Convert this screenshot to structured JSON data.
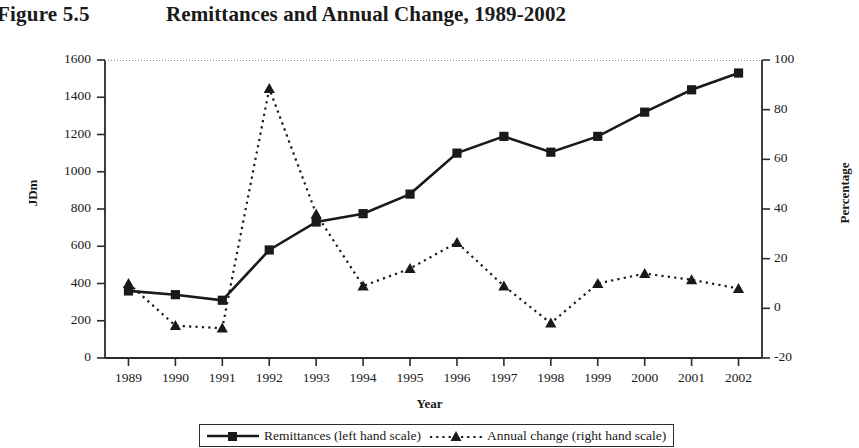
{
  "figure": {
    "label": "Figure 5.5",
    "title": "Remittances and Annual Change, 1989-2002"
  },
  "chart_data": {
    "type": "line",
    "title": "Remittances and Annual Change, 1989-2002",
    "figure_label": "Figure 5.5",
    "xlabel": "Year",
    "ylabel": "JDm",
    "y2label": "Percentage",
    "grid": false,
    "legend_position": "bottom",
    "categories": [
      "1989",
      "1990",
      "1991",
      "1992",
      "1993",
      "1994",
      "1995",
      "1996",
      "1997",
      "1998",
      "1999",
      "2000",
      "2001",
      "2002"
    ],
    "x_tick_labels": [
      "1989",
      "1990",
      "1991",
      "1992",
      "1993",
      "1994",
      "1995",
      "1996",
      "1997",
      "1998",
      "1999",
      "2000",
      "2001",
      "2002"
    ],
    "ylim": [
      0,
      1600
    ],
    "y_tick_labels": [
      "1600",
      "1400",
      "1200",
      "1000",
      "800",
      "600",
      "400",
      "200",
      "0"
    ],
    "y_ticks": [
      1600,
      1400,
      1200,
      1000,
      800,
      600,
      400,
      200,
      0
    ],
    "y2lim": [
      -20,
      100
    ],
    "y2_tick_labels": [
      "100",
      "80",
      "60",
      "40",
      "20",
      "0",
      "-20"
    ],
    "y2_ticks": [
      100,
      80,
      60,
      40,
      20,
      0,
      -20
    ],
    "series": [
      {
        "name": "Remittances (left hand scale)",
        "axis": "left",
        "marker": "square",
        "linestyle": "solid",
        "color": "#1a1a1a",
        "values": [
          360,
          340,
          310,
          580,
          730,
          775,
          880,
          1100,
          1190,
          1105,
          1190,
          1320,
          1440,
          1530
        ]
      },
      {
        "name": "Annual change (right hand scale)",
        "axis": "right",
        "marker": "triangle",
        "linestyle": "dotted",
        "color": "#1a1a1a",
        "values": [
          10,
          -7,
          -8,
          88.5,
          38,
          9,
          16,
          26.5,
          9,
          -6,
          10,
          14,
          11.5,
          8
        ]
      }
    ]
  },
  "legend": {
    "items": [
      {
        "label": "Remittances (left hand scale)",
        "marker": "square-marker",
        "line": "solid-line"
      },
      {
        "label": "Annual change (right hand scale)",
        "marker": "triangle-marker",
        "line": "dotted-line"
      }
    ]
  },
  "colors": {
    "ink": "#1a1a1a",
    "axis": "#2b2b2b",
    "background": "#ffffff"
  }
}
